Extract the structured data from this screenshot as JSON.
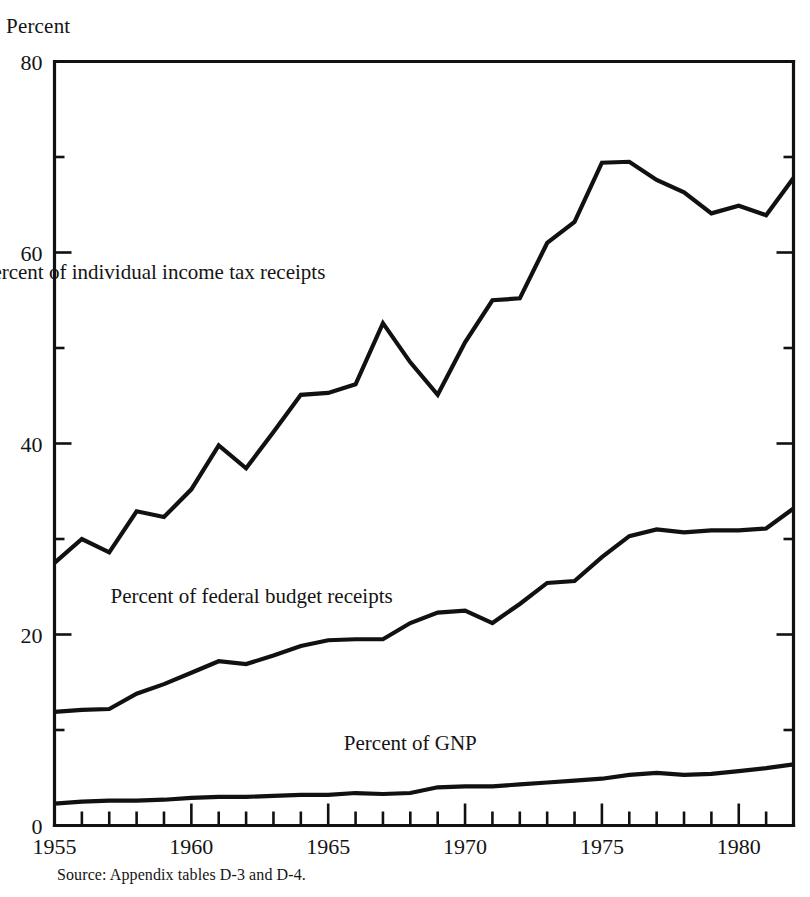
{
  "figure": {
    "y_axis_title": "Percent",
    "source_note": "Source:  Appendix tables D-3 and D-4."
  },
  "chart_data": {
    "type": "line",
    "title": "",
    "subtitle": "",
    "xlabel": "",
    "ylabel": "Percent",
    "xlim": [
      1955,
      1982
    ],
    "ylim": [
      0,
      80
    ],
    "grid": false,
    "legend_position": "inline-annotations",
    "y_major_ticks": [
      0,
      20,
      40,
      60,
      80
    ],
    "y_minor_ticks": [
      10,
      30,
      50,
      70
    ],
    "y_tick_labels": [
      "0",
      "20",
      "40",
      "60",
      "80"
    ],
    "x_major_ticks": [
      1955,
      1960,
      1965,
      1970,
      1975,
      1980
    ],
    "x_tick_labels": [
      "1955",
      "1960",
      "1965",
      "1970",
      "1975",
      "1980"
    ],
    "x_minor_ticks": [
      1956,
      1957,
      1958,
      1959,
      1961,
      1962,
      1963,
      1964,
      1966,
      1967,
      1968,
      1969,
      1971,
      1972,
      1973,
      1974,
      1976,
      1977,
      1978,
      1979,
      1981,
      1982
    ],
    "x": [
      1955,
      1956,
      1957,
      1958,
      1959,
      1960,
      1961,
      1962,
      1963,
      1964,
      1965,
      1966,
      1967,
      1968,
      1969,
      1970,
      1971,
      1972,
      1973,
      1974,
      1975,
      1976,
      1977,
      1978,
      1979,
      1980,
      1981,
      1982
    ],
    "series": [
      {
        "name": "Percent of individual income tax receipts",
        "label": "Percent of individual income tax receipts",
        "label_x": 1958.6,
        "label_y": 57.2,
        "values": [
          27.5,
          30.0,
          28.6,
          32.9,
          32.3,
          35.2,
          39.8,
          37.4,
          41.2,
          45.1,
          45.3,
          46.2,
          52.6,
          48.5,
          45.1,
          50.6,
          55.0,
          55.2,
          61.0,
          63.2,
          69.4,
          69.5,
          67.6,
          66.3,
          64.1,
          64.9,
          63.9,
          67.8
        ]
      },
      {
        "name": "Percent of federal budget receipts",
        "label": "Percent of federal budget receipts",
        "label_x": 1962.2,
        "label_y": 23.3,
        "values": [
          11.9,
          12.1,
          12.2,
          13.8,
          14.8,
          16.0,
          17.2,
          16.9,
          17.8,
          18.8,
          19.4,
          19.5,
          19.5,
          21.2,
          22.3,
          22.5,
          21.2,
          23.2,
          25.4,
          25.6,
          28.1,
          30.3,
          31.0,
          30.7,
          30.9,
          30.9,
          31.1,
          33.2
        ]
      },
      {
        "name": "Percent of GNP",
        "label": "Percent of GNP",
        "label_x": 1968.0,
        "label_y": 7.9,
        "values": [
          2.3,
          2.5,
          2.6,
          2.6,
          2.7,
          2.9,
          3.0,
          3.0,
          3.1,
          3.2,
          3.2,
          3.4,
          3.3,
          3.4,
          4.0,
          4.1,
          4.1,
          4.3,
          4.5,
          4.7,
          4.9,
          5.3,
          5.5,
          5.3,
          5.4,
          5.7,
          6.0,
          6.4
        ]
      }
    ]
  }
}
